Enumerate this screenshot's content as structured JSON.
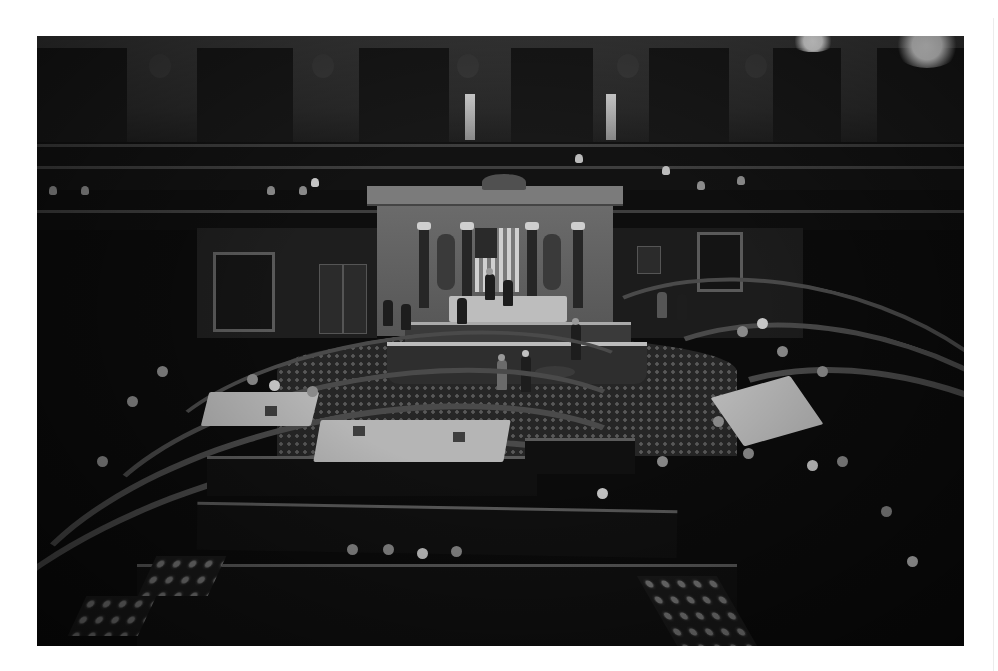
{
  "image": {
    "description": "Black-and-white photograph of the interior of the U.S. House of Representatives chamber viewed from the upper gallery, showing the Speaker's rostrum with American flag, semicircular rows of benches, members seated and standing, and visitors in the galleries.",
    "color_mode": "grayscale",
    "frame": {
      "left": 37,
      "top": 36,
      "width": 927,
      "height": 610
    },
    "background": "#ffffff",
    "elements": {
      "rostrum": "Speaker's rostrum with tiered marble dais",
      "flag": "American flag flanked by fasces",
      "galleries": "Upper visitor galleries with scattered spectators",
      "seating": "Curved rows of wooden benches in semicircle",
      "tables": "Two party leadership tables with lecterns on the floor",
      "carpet": "Patterned carpet in the well and aisles",
      "lights": "Bright ceiling lights at top right"
    }
  }
}
